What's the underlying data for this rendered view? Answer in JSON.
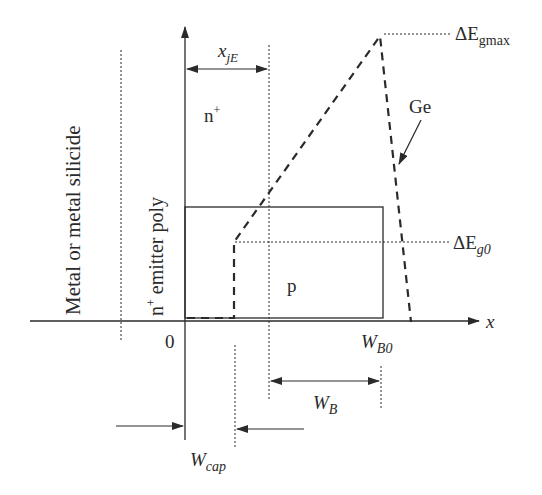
{
  "diagram": {
    "labels": {
      "x_axis": "x",
      "origin": "0",
      "n_plus_symbol": "n",
      "plus_sup": "+",
      "p_region": "p",
      "xjE_main": "x",
      "xjE_sub": "jE",
      "delta_egmax_main": "ΔE",
      "delta_egmax_sub": "gmax",
      "delta_eg0_main": "ΔE",
      "delta_eg0_sub": "g0",
      "ge": "Ge",
      "wb0_main": "W",
      "wb0_sub": "B0",
      "wb_main": "W",
      "wb_sub": "B",
      "wcap_main": "W",
      "wcap_sub": "cap",
      "metal_silicide": "Metal or metal silicide",
      "emitter_poly_n": "n",
      "emitter_poly_rest": " emitter poly"
    },
    "colors": {
      "line": "#2a2a2a",
      "background": "#ffffff"
    }
  }
}
